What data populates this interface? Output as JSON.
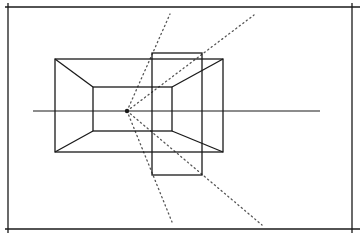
{
  "diagram": {
    "title": "",
    "type": "one-point-perspective",
    "colors": {
      "ink": "#1a1a1a",
      "dots": "#555555",
      "background": "#ffffff"
    },
    "frame": {
      "top": [
        5,
        7,
        360,
        7
      ],
      "left": [
        8,
        3,
        8,
        233
      ],
      "bottom": [
        5,
        229,
        360,
        229
      ],
      "right": [
        352,
        3,
        352,
        233
      ]
    },
    "horizon": [
      33,
      111,
      320,
      111
    ],
    "vanishing_point": [
      127,
      111
    ],
    "outer_rect": {
      "x": 55,
      "y": 59,
      "w": 168,
      "h": 93
    },
    "inner_rect": {
      "x": 93,
      "y": 87,
      "w": 79,
      "h": 44
    },
    "overlay_rect": {
      "x": 152,
      "y": 53,
      "w": 50,
      "h": 122
    },
    "diagonals": [
      [
        55,
        59,
        93,
        87
      ],
      [
        223,
        59,
        172,
        87
      ],
      [
        55,
        152,
        93,
        131
      ],
      [
        223,
        152,
        172,
        131
      ]
    ],
    "dotted_rays": [
      [
        127,
        111,
        170,
        14
      ],
      [
        127,
        111,
        254,
        15
      ],
      [
        127,
        111,
        172,
        222
      ],
      [
        127,
        111,
        262,
        225
      ]
    ]
  }
}
